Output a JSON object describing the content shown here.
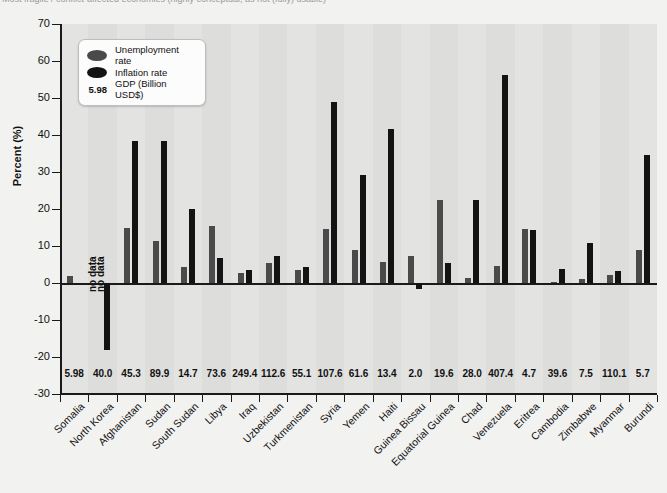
{
  "header": {
    "cut_title": "Most fragile / conflict-affected economies (highly conceptual, as not (fully) usable)"
  },
  "legend": {
    "items": [
      {
        "key": "unemployment",
        "label": "Unemployment rate",
        "color": "#4a4a4a",
        "marker": "ellipse-swatch"
      },
      {
        "key": "inflation",
        "label": "Inflation rate",
        "color": "#131313",
        "marker": "ellipse-swatch"
      }
    ],
    "gdp_sample_value": "5.98",
    "gdp_label": "GDP (Billion USD$)"
  },
  "axes": {
    "y_title": "Percent (%)",
    "y_ticks": [
      70,
      60,
      50,
      40,
      30,
      20,
      10,
      0,
      -10,
      -20,
      -30
    ],
    "y_tick_labels": [
      "70",
      "60",
      "50",
      "40",
      "30",
      "20",
      "10",
      "0",
      "-10",
      "-20",
      "-30"
    ],
    "y_min": -30,
    "y_max": 70
  },
  "annotations": [
    {
      "text": "no data",
      "category": "North Korea",
      "series": "unemployment"
    },
    {
      "text": "no data",
      "category": "North Korea",
      "series": "inflation"
    }
  ],
  "chart_data": {
    "type": "bar",
    "title": "",
    "xlabel": "",
    "ylabel": "Percent (%)",
    "ylim": [
      -30,
      70
    ],
    "grid": false,
    "legend_position": "upper-left-inset",
    "categories": [
      "Somalia",
      "North Korea",
      "Afghanistan",
      "Sudan",
      "South Sudan",
      "Libya",
      "Iraq",
      "Uzbekistan",
      "Turkmenistan",
      "Syria",
      "Yemen",
      "Haiti",
      "Guinea Bissau",
      "Equatorial Guinea",
      "Chad",
      "Venezuela",
      "Eritrea",
      "Cambodia",
      "Zimbabwe",
      "Myanmar",
      "Burundi"
    ],
    "gdp_billion_usd": [
      "5.98",
      "40.0",
      "45.3",
      "89.9",
      "14.7",
      "73.6",
      "249.4",
      "112.6",
      "55.1",
      "107.6",
      "61.6",
      "13.4",
      "2.0",
      "19.6",
      "28.0",
      "407.4",
      "4.7",
      "39.6",
      "7.5",
      "110.1",
      "5.7"
    ],
    "series": [
      {
        "name": "Unemployment rate",
        "color": "#4a4a4a",
        "values": [
          2.0,
          null,
          14.8,
          11.3,
          4.3,
          2.6,
          5.4,
          3.5,
          14.5,
          8.8,
          5.7,
          7.4,
          22.3,
          1.4,
          22.5,
          4.5,
          14.6,
          3.7,
          1.1,
          2.1,
          1.9
        ]
      },
      {
        "name": "Inflation rate",
        "color": "#131313",
        "values": [
          -18.2,
          null,
          38.3,
          20.1,
          15.3,
          6.8,
          3.5,
          49.0,
          29.2,
          41.6,
          -1.5,
          5.4,
          4.7,
          56.1,
          14.2,
          3.2,
          10.7,
          3.3,
          34.5,
          8.9,
          null
        ]
      }
    ],
    "points": [
      {
        "category": "Somalia",
        "gdp": "5.98",
        "unemployment": 2.0,
        "inflation": null
      },
      {
        "category": "North Korea",
        "gdp": "40.0",
        "unemployment": null,
        "inflation": -18.2
      },
      {
        "category": "Afghanistan",
        "gdp": "45.3",
        "unemployment": 14.8,
        "inflation": 38.3
      },
      {
        "category": "Sudan",
        "gdp": "89.9",
        "unemployment": 11.3,
        "inflation": 38.3
      },
      {
        "category": "South Sudan",
        "gdp": "14.7",
        "unemployment": 4.3,
        "inflation": 20.1
      },
      {
        "category": "Libya",
        "gdp": "73.6",
        "unemployment": 15.3,
        "inflation": 6.8
      },
      {
        "category": "Iraq",
        "gdp": "249.4",
        "unemployment": 2.6,
        "inflation": 3.5
      },
      {
        "category": "Uzbekistan",
        "gdp": "112.6",
        "unemployment": 5.4,
        "inflation": 7.3
      },
      {
        "category": "Turkmenistan",
        "gdp": "55.1",
        "unemployment": 3.5,
        "inflation": 4.4
      },
      {
        "category": "Syria",
        "gdp": "107.6",
        "unemployment": 14.5,
        "inflation": 49.0
      },
      {
        "category": "Yemen",
        "gdp": "61.6",
        "unemployment": 8.8,
        "inflation": 29.2
      },
      {
        "category": "Haiti",
        "gdp": "13.4",
        "unemployment": 5.7,
        "inflation": 41.6
      },
      {
        "category": "Guinea Bissau",
        "gdp": "2.0",
        "unemployment": 7.4,
        "inflation": -1.5
      },
      {
        "category": "Equatorial Guinea",
        "gdp": "19.6",
        "unemployment": 22.3,
        "inflation": 5.4
      },
      {
        "category": "Chad",
        "gdp": "28.0",
        "unemployment": 1.4,
        "inflation": 22.5
      },
      {
        "category": "Venezuela",
        "gdp": "407.4",
        "unemployment": 4.5,
        "inflation": 56.1
      },
      {
        "category": "Eritrea",
        "gdp": "4.7",
        "unemployment": 14.6,
        "inflation": 14.2
      },
      {
        "category": "Cambodia",
        "gdp": "39.6",
        "unemployment": 0.4,
        "inflation": 3.7
      },
      {
        "category": "Zimbabwe",
        "gdp": "7.5",
        "unemployment": 1.1,
        "inflation": 10.7
      },
      {
        "category": "Myanmar",
        "gdp": "110.1",
        "unemployment": 2.1,
        "inflation": 3.3
      },
      {
        "category": "Burundi",
        "gdp": "5.7",
        "unemployment": 8.9,
        "inflation": 34.5
      }
    ]
  }
}
